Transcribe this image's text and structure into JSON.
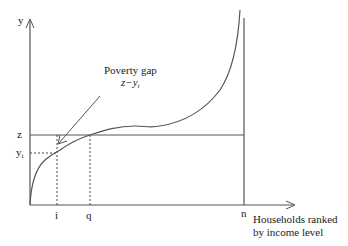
{
  "diagram": {
    "type": "poverty-gap-income-curve",
    "axes": {
      "y_label": "y",
      "x_label_line1": "Households ranked",
      "x_label_line2": "by income level"
    },
    "y_ticks": {
      "z": "z",
      "yi": "y",
      "yi_sub": "i"
    },
    "x_ticks": {
      "i": "i",
      "q": "q",
      "n": "n"
    },
    "annotation": {
      "title": "Poverty gap",
      "formula_main": "z−y",
      "formula_sub": "i"
    },
    "colors": {
      "line": "#555555",
      "text": "#222222",
      "background": "#ffffff"
    }
  }
}
